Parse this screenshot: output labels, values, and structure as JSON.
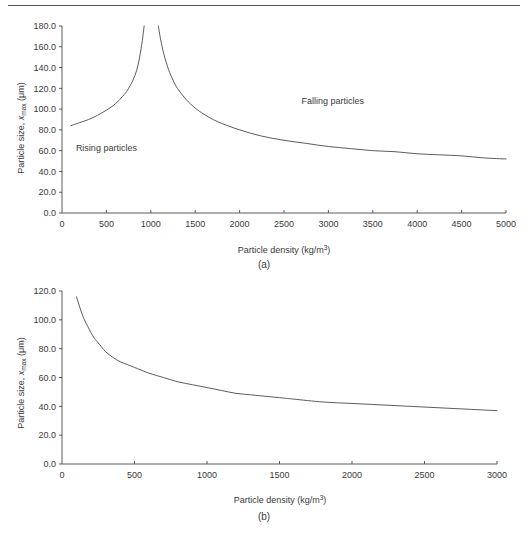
{
  "figure": {
    "panels": [
      {
        "id": "a",
        "caption": "(a)",
        "xlabel_main": "Particle density (kg/m",
        "xlabel_sup": "3",
        "xlabel_tail": ")",
        "ylabel_main": "Particle size, ",
        "ylabel_var": "x",
        "ylabel_sub": "max",
        "ylabel_unit": " (μm)",
        "annotations": [
          {
            "text": "Rising particles",
            "x": 500,
            "y": 60
          },
          {
            "text": "Falling particles",
            "x": 3050,
            "y": 105
          }
        ]
      },
      {
        "id": "b",
        "caption": "(b)",
        "xlabel_main": "Particle density (kg/m",
        "xlabel_sup": "3",
        "xlabel_tail": ")",
        "ylabel_main": "Particle size, ",
        "ylabel_var": "x",
        "ylabel_sub": "max",
        "ylabel_unit": " (μm)",
        "annotations": []
      }
    ]
  },
  "chart_data": [
    {
      "type": "line",
      "panel": "a",
      "title": "",
      "xlabel": "Particle density (kg/m3)",
      "ylabel": "Particle size, xmax (μm)",
      "xlim": [
        0,
        5000
      ],
      "ylim": [
        0,
        180
      ],
      "xticks": [
        0,
        500,
        1000,
        1500,
        2000,
        2500,
        3000,
        3500,
        4000,
        4500,
        5000
      ],
      "yticks": [
        0.0,
        20.0,
        40.0,
        60.0,
        80.0,
        100.0,
        120.0,
        140.0,
        160.0,
        180.0
      ],
      "ytick_labels": [
        "0.0",
        "20.0",
        "40.0",
        "60.0",
        "80.0",
        "100.0",
        "120.0",
        "140.0",
        "160.0",
        "180.0"
      ],
      "xtick_labels": [
        "0",
        "500",
        "1000",
        "1500",
        "2000",
        "2500",
        "3000",
        "3500",
        "4000",
        "4500",
        "5000"
      ],
      "grid": false,
      "legend": "none",
      "annotations": [
        "Rising particles",
        "Falling particles"
      ],
      "series": [
        {
          "name": "Rising particles branch",
          "x": [
            100,
            200,
            300,
            400,
            500,
            600,
            700,
            750,
            800,
            840,
            870,
            890,
            905,
            915,
            925
          ],
          "y": [
            84,
            87,
            90,
            94,
            99,
            105,
            114,
            120,
            128,
            137,
            148,
            158,
            166,
            173,
            180
          ]
        },
        {
          "name": "Falling particles branch",
          "x": [
            1085,
            1100,
            1120,
            1150,
            1200,
            1250,
            1300,
            1400,
            1500,
            1600,
            1750,
            2000,
            2250,
            2500,
            2750,
            3000,
            3250,
            3500,
            3750,
            4000,
            4250,
            4500,
            4750,
            5000
          ],
          "y": [
            180,
            172,
            163,
            152,
            138,
            128,
            120,
            109,
            101,
            95,
            88,
            80,
            74,
            70,
            67,
            64,
            62,
            60,
            59,
            57,
            56,
            55,
            53,
            52
          ]
        }
      ]
    },
    {
      "type": "line",
      "panel": "b",
      "title": "",
      "xlabel": "Particle density (kg/m3)",
      "ylabel": "Particle size, xmax (μm)",
      "xlim": [
        0,
        3000
      ],
      "ylim": [
        0,
        120
      ],
      "xticks": [
        0,
        500,
        1000,
        1500,
        2000,
        2500,
        3000
      ],
      "yticks": [
        0.0,
        20.0,
        40.0,
        60.0,
        80.0,
        100.0,
        120.0
      ],
      "ytick_labels": [
        "0.0",
        "20.0",
        "40.0",
        "60.0",
        "80.0",
        "100.0",
        "120.0"
      ],
      "xtick_labels": [
        "0",
        "500",
        "1000",
        "1500",
        "2000",
        "2500",
        "3000"
      ],
      "grid": false,
      "legend": "none",
      "annotations": [],
      "series": [
        {
          "name": "Maximum particle size",
          "x": [
            100,
            125,
            150,
            175,
            200,
            225,
            250,
            300,
            350,
            400,
            450,
            500,
            600,
            700,
            800,
            900,
            1000,
            1100,
            1200,
            1300,
            1400,
            1500,
            1600,
            1800,
            2000,
            2200,
            2400,
            2600,
            2800,
            3000
          ],
          "y": [
            116,
            108,
            101,
            96,
            91,
            87,
            84,
            78,
            74,
            71,
            69,
            67,
            63,
            60,
            57,
            55,
            53,
            51,
            49,
            48,
            47,
            46,
            45,
            43,
            42,
            41,
            40,
            39,
            38,
            37
          ]
        }
      ]
    }
  ]
}
